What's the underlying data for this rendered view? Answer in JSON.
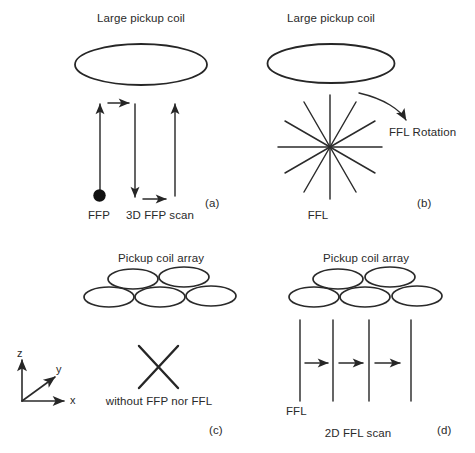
{
  "figure": {
    "background_color": "#ffffff",
    "stroke_color": "#262626",
    "width": 475,
    "height": 453
  },
  "panels": [
    {
      "id": "a",
      "panel_label": "(a)",
      "coil_title": "Large pickup coil",
      "coil_type": "single-large-ellipse",
      "field_free_label": "FFP",
      "scan_label": "3D FFP scan",
      "scan_arrows": {
        "vertical_count": 3,
        "vertical_directions": [
          "up",
          "down",
          "up"
        ],
        "horizontal_count": 2,
        "horizontal_directions": [
          "right",
          "right"
        ]
      },
      "marker": "filled-dot"
    },
    {
      "id": "b",
      "panel_label": "(b)",
      "coil_title": "Large pickup coil",
      "coil_type": "single-large-ellipse",
      "field_free_label": "FFL",
      "scan_label": "FFL Rotation",
      "star_rays": 12,
      "rotation_arrow": "curved-clockwise"
    },
    {
      "id": "c",
      "panel_label": "(c)",
      "coil_title": "Pickup coil array",
      "coil_type": "array-5-ellipses",
      "array_rows": [
        2,
        3
      ],
      "scan_label": "without FFP nor FFL",
      "marker": "x-cross"
    },
    {
      "id": "d",
      "panel_label": "(d)",
      "coil_title": "Pickup coil array",
      "coil_type": "array-5-ellipses",
      "array_rows": [
        2,
        3
      ],
      "field_free_label": "FFL",
      "scan_label": "2D FFL scan",
      "scan_arrows": {
        "vertical_lines": 4,
        "horizontal_count": 3,
        "horizontal_directions": [
          "right",
          "right",
          "right"
        ]
      }
    }
  ],
  "axes_triad": {
    "z_label": "z",
    "y_label": "y",
    "x_label": "x"
  }
}
